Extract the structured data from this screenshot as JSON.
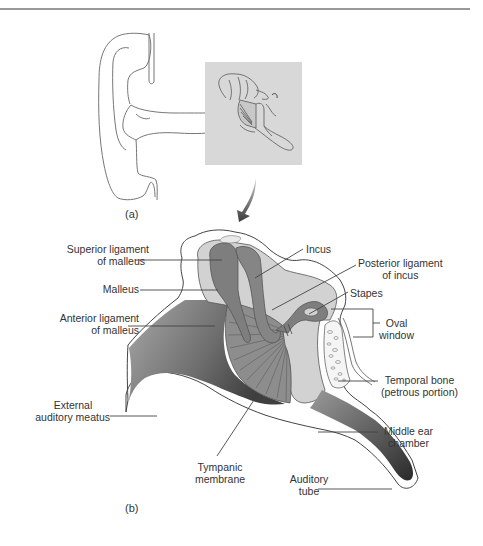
{
  "figure": {
    "panels": [
      {
        "id": "a",
        "label": "(a)",
        "description": "Outer ear with inset of middle ear region"
      },
      {
        "id": "b",
        "label": "(b)",
        "description": "Enlarged cross-section of middle ear"
      }
    ],
    "labels": {
      "superior_ligament_line1": "Superior ligament",
      "superior_ligament_line2": "of malleus",
      "malleus": "Malleus",
      "anterior_ligament_line1": "Anterior ligament",
      "anterior_ligament_line2": "of malleus",
      "external_meatus_line1": "External",
      "external_meatus_line2": "auditory meatus",
      "incus": "Incus",
      "posterior_ligament_line1": "Posterior ligament",
      "posterior_ligament_line2": "of incus",
      "stapes": "Stapes",
      "oval_window_line1": "Oval",
      "oval_window_line2": "window",
      "temporal_bone_line1": "Temporal bone",
      "temporal_bone_line2": "(petrous portion)",
      "middle_ear_line1": "Middle ear",
      "middle_ear_line2": "chamber",
      "tympanic_line1": "Tympanic",
      "tympanic_line2": "membrane",
      "auditory_tube_line1": "Auditory",
      "auditory_tube_line2": "tube"
    },
    "colors": {
      "line": "#555555",
      "ossicle_dark": "#7a7a7a",
      "ossicle_light": "#c9c9c9",
      "chamber_fill": "#d4d4d4",
      "canal_dark": "#4a4a4a",
      "inset_bg": "#d9d9d9"
    }
  }
}
